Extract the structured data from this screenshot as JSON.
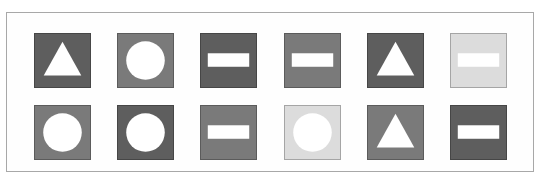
{
  "figure": {
    "colors": {
      "dark": "#5e5e5e",
      "medium": "#7a7a7a",
      "light": "#dcdcdc",
      "shape": "#ffffff",
      "frame_border": "#a8a8a8"
    },
    "rows": [
      [
        {
          "shape": "triangle",
          "shade": "dark"
        },
        {
          "shape": "circle",
          "shade": "medium"
        },
        {
          "shape": "rectangle",
          "shade": "dark"
        },
        {
          "shape": "rectangle",
          "shade": "medium"
        },
        {
          "shape": "triangle",
          "shade": "dark"
        },
        {
          "shape": "rectangle",
          "shade": "light"
        }
      ],
      [
        {
          "shape": "circle",
          "shade": "medium"
        },
        {
          "shape": "circle",
          "shade": "dark"
        },
        {
          "shape": "rectangle",
          "shade": "medium"
        },
        {
          "shape": "circle",
          "shade": "light"
        },
        {
          "shape": "triangle",
          "shade": "medium"
        },
        {
          "shape": "rectangle",
          "shade": "dark"
        }
      ]
    ]
  }
}
